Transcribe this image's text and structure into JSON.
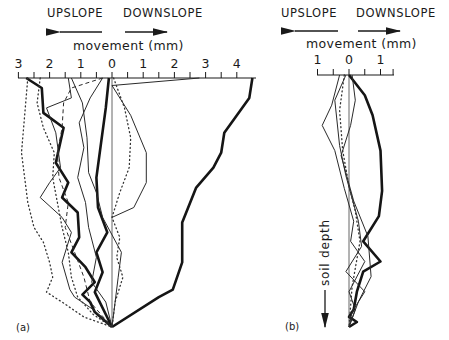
{
  "figure": {
    "panel_a": {
      "label": "(a)",
      "direction_left": "UPSLOPE",
      "direction_right": "DOWNSLOPE",
      "axis_title": "movement (mm)",
      "tick_labels": [
        "3",
        "2",
        "1",
        "0",
        "1",
        "2",
        "3",
        "4"
      ]
    },
    "panel_b": {
      "label": "(b)",
      "direction_left": "UPSLOPE",
      "direction_right": "DOWNSLOPE",
      "axis_title": "movement (mm)",
      "tick_labels": [
        "1",
        "0",
        "1"
      ],
      "depth_label": "soil depth"
    }
  },
  "chart_data": [
    {
      "type": "line",
      "panel": "(a)",
      "title": "",
      "xlabel": "movement (mm)",
      "ylabel": "soil depth",
      "x_direction_labels": {
        "negative": "UPSLOPE",
        "positive": "DOWNSLOPE"
      },
      "xlim": [
        -3,
        4.3
      ],
      "x_ticks": [
        -3,
        -2,
        -1,
        0,
        1,
        2,
        3,
        4
      ],
      "x_tick_labels": [
        "3",
        "2",
        "1",
        "0",
        "1",
        "2",
        "3",
        "4"
      ],
      "depth_axis": "downward, unlabelled scale (0 at surface to 1 at base)",
      "grid": false,
      "series": [
        {
          "name": "profile 1 (bold)",
          "style": "bold",
          "points_x_mm": [
            4.5,
            4.4,
            3.6,
            3.5,
            3.25,
            2.7,
            2.25,
            2.25,
            1.95,
            1.5,
            0.0
          ],
          "points_depth": [
            0.0,
            0.08,
            0.22,
            0.3,
            0.36,
            0.44,
            0.58,
            0.74,
            0.85,
            0.88,
            1.0
          ]
        },
        {
          "name": "profile 2 (bold)",
          "style": "bold",
          "points_x_mm": [
            -2.75,
            -2.25,
            -2.2,
            -1.55,
            -1.8,
            -1.4,
            -1.6,
            -1.1,
            -1.05,
            -1.3,
            -0.85,
            -0.55,
            -0.95,
            -0.7,
            -0.55,
            0.0
          ],
          "points_depth": [
            0.0,
            0.04,
            0.14,
            0.2,
            0.34,
            0.42,
            0.48,
            0.54,
            0.64,
            0.7,
            0.76,
            0.82,
            0.87,
            0.9,
            0.94,
            1.0
          ]
        },
        {
          "name": "profile 3 (bold)",
          "style": "bold",
          "points_x_mm": [
            -0.1,
            -0.2,
            -0.35,
            -0.5,
            -0.45,
            -0.15,
            -0.5,
            -0.3,
            -0.55,
            0.0
          ],
          "points_depth": [
            0.0,
            0.12,
            0.26,
            0.4,
            0.52,
            0.62,
            0.7,
            0.78,
            0.86,
            1.0
          ]
        },
        {
          "name": "profile 4",
          "style": "thin",
          "points_x_mm": [
            2.8,
            0.0,
            0.6,
            1.1,
            1.1,
            0.7,
            0.0
          ],
          "points_depth": [
            0.0,
            0.03,
            0.15,
            0.3,
            0.42,
            0.52,
            0.56
          ]
        },
        {
          "name": "profile 5",
          "style": "thin",
          "points_x_mm": [
            -1.4,
            -1.3,
            -2.1,
            -1.8,
            -1.65,
            -2.0,
            -2.3,
            -1.6,
            -1.3,
            -1.6,
            -1.35,
            -1.2,
            -0.6,
            0.0
          ],
          "points_depth": [
            0.0,
            0.08,
            0.12,
            0.22,
            0.36,
            0.42,
            0.48,
            0.56,
            0.62,
            0.74,
            0.85,
            0.88,
            0.93,
            1.0
          ]
        },
        {
          "name": "profile 6",
          "style": "thin",
          "points_x_mm": [
            -0.3,
            -0.7,
            -1.05,
            -0.9,
            -1.1,
            -0.85,
            -0.75,
            -0.5,
            -0.65,
            -0.2,
            0.0
          ],
          "points_depth": [
            0.0,
            0.08,
            0.18,
            0.28,
            0.4,
            0.5,
            0.6,
            0.72,
            0.82,
            0.9,
            1.0
          ]
        },
        {
          "name": "profile 7",
          "style": "thin",
          "points_x_mm": [
            -1.3,
            -0.95,
            -0.8,
            -0.75,
            -0.5,
            -0.3,
            0.3,
            0.2,
            0.1,
            0.0
          ],
          "points_depth": [
            0.0,
            0.1,
            0.24,
            0.38,
            0.46,
            0.56,
            0.7,
            0.8,
            0.9,
            1.0
          ]
        },
        {
          "name": "profile 8 (dashed)",
          "style": "dashed",
          "points_x_mm": [
            -0.3,
            -1.3,
            -1.55,
            -1.6,
            -1.75,
            -1.7,
            -1.4,
            -1.5,
            -1.2,
            -0.9,
            -0.7,
            0.0
          ],
          "points_depth": [
            0.0,
            0.04,
            0.1,
            0.2,
            0.3,
            0.4,
            0.5,
            0.6,
            0.7,
            0.8,
            0.9,
            1.0
          ]
        },
        {
          "name": "profile 9 (dotted)",
          "style": "dotted",
          "points_x_mm": [
            -2.3,
            -2.4,
            -2.2,
            -1.85,
            -1.9,
            -1.75,
            -1.6,
            -1.4,
            -1.3,
            -1.1,
            -0.6,
            0.0
          ],
          "points_depth": [
            0.0,
            0.1,
            0.2,
            0.3,
            0.4,
            0.5,
            0.6,
            0.7,
            0.8,
            0.88,
            0.95,
            1.0
          ]
        },
        {
          "name": "profile 10 (dotted)",
          "style": "dotted",
          "points_x_mm": [
            0.05,
            0.4,
            0.6,
            0.55,
            0.25,
            0.0,
            0.25,
            0.15,
            0.35,
            0.1,
            0.0
          ],
          "points_depth": [
            0.0,
            0.12,
            0.24,
            0.36,
            0.46,
            0.56,
            0.64,
            0.72,
            0.8,
            0.9,
            1.0
          ]
        },
        {
          "name": "profile 11 (dotted)",
          "style": "dotted",
          "points_x_mm": [
            -2.7,
            -2.9,
            -2.7,
            -2.5,
            -2.2,
            -2.0,
            -1.9,
            -2.1,
            -1.6,
            -0.9,
            0.0
          ],
          "points_depth": [
            0.0,
            0.3,
            0.5,
            0.6,
            0.66,
            0.74,
            0.8,
            0.86,
            0.9,
            0.96,
            1.0
          ]
        }
      ]
    },
    {
      "type": "line",
      "panel": "(b)",
      "title": "",
      "xlabel": "movement (mm)",
      "ylabel": "soil depth",
      "x_direction_labels": {
        "negative": "UPSLOPE",
        "positive": "DOWNSLOPE"
      },
      "xlim": [
        -1.2,
        1.4
      ],
      "x_ticks": [
        -1,
        -0.5,
        0,
        0.5,
        1,
        1.4
      ],
      "x_tick_labels": [
        "1",
        "0",
        "1"
      ],
      "depth_axis": "downward (arrow labelled 'soil depth'), unlabelled scale",
      "grid": false,
      "series": [
        {
          "name": "profile 1 (bold)",
          "style": "bold",
          "points_x_mm": [
            0.0,
            0.5,
            0.75,
            1.0,
            1.05,
            0.95,
            0.45,
            1.0,
            0.45,
            0.25,
            0.15,
            0.0,
            0.25,
            0.0
          ],
          "points_depth": [
            0.0,
            0.08,
            0.16,
            0.3,
            0.46,
            0.56,
            0.66,
            0.74,
            0.78,
            0.86,
            0.93,
            0.96,
            0.98,
            1.0
          ]
        },
        {
          "name": "profile 2",
          "style": "thin",
          "points_x_mm": [
            -0.3,
            -0.55,
            -0.85,
            -0.45,
            -0.15,
            0.15,
            0.05,
            0.5,
            0.0,
            0.2,
            0.0
          ],
          "points_depth": [
            0.0,
            0.12,
            0.2,
            0.3,
            0.45,
            0.58,
            0.66,
            0.74,
            0.86,
            0.93,
            1.0
          ]
        },
        {
          "name": "profile 3",
          "style": "thin",
          "points_x_mm": [
            -0.1,
            -0.45,
            -0.3,
            -0.1,
            0.3,
            0.4,
            -0.1,
            0.5,
            0.1,
            0.0
          ],
          "points_depth": [
            0.0,
            0.1,
            0.28,
            0.4,
            0.58,
            0.68,
            0.78,
            0.86,
            0.94,
            1.0
          ]
        },
        {
          "name": "profile 4",
          "style": "thin",
          "points_x_mm": [
            0.1,
            0.2,
            0.05,
            -0.25,
            0.15,
            0.6,
            0.7,
            0.3,
            0.0
          ],
          "points_depth": [
            0.0,
            0.1,
            0.2,
            0.32,
            0.5,
            0.64,
            0.8,
            0.9,
            1.0
          ]
        },
        {
          "name": "profile 5 (dotted)",
          "style": "dotted",
          "points_x_mm": [
            -0.15,
            -0.3,
            -0.2,
            0.0,
            0.2,
            0.35,
            0.1,
            0.0
          ],
          "points_depth": [
            0.0,
            0.14,
            0.3,
            0.44,
            0.54,
            0.66,
            0.84,
            1.0
          ]
        }
      ]
    }
  ]
}
